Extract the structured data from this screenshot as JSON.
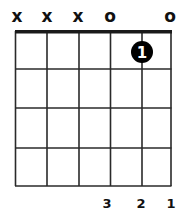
{
  "chord": {
    "strings_count": 6,
    "frets_shown": 4,
    "string_markers": [
      "x",
      "x",
      "x",
      "o",
      "",
      "o"
    ],
    "fingers": [
      {
        "string_index": 4,
        "fret": 1,
        "label": "1"
      }
    ],
    "bottom_labels": [
      "",
      "",
      "",
      "3",
      "2",
      "1"
    ]
  },
  "colors": {
    "line": "#2a2a2a",
    "nut": "#1a1a1a",
    "dot": "#000000",
    "dot_text": "#ffffff",
    "label": "#111111"
  }
}
